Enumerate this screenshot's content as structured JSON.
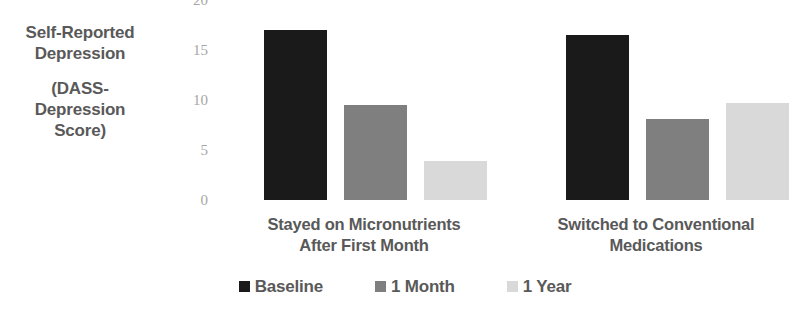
{
  "chart_data": {
    "type": "bar",
    "title": "",
    "subtitle": "",
    "xlabel": "",
    "ylabel": "Self-Reported Depression (DASS-Depression Score)",
    "ylabel_lines": [
      "Self-Reported",
      "Depression",
      "(DASS-",
      "Depression",
      "Score)"
    ],
    "categories": [
      "Stayed on Micronutrients After First Month",
      "Switched to Conventional Medications"
    ],
    "category_lines": [
      [
        "Stayed on Micronutrients",
        "After First Month"
      ],
      [
        "Switched to Conventional",
        "Medications"
      ]
    ],
    "series": [
      {
        "name": "Baseline",
        "color": "#1a1a1a",
        "values": [
          17.0,
          16.5
        ]
      },
      {
        "name": "1 Month",
        "color": "#7f7f7f",
        "values": [
          9.5,
          8.1
        ]
      },
      {
        "name": "1 Year",
        "color": "#d9d9d9",
        "values": [
          3.9,
          9.7
        ]
      }
    ],
    "ylim": [
      0,
      20
    ],
    "yticks": [
      0,
      5,
      10,
      15,
      20
    ],
    "ytick_labels": [
      "0",
      "5",
      "10",
      "15",
      "20"
    ],
    "grid": false,
    "legend_position": "bottom"
  },
  "axis": {
    "tick_color": "#a6a6a6",
    "label_color": "#595959"
  }
}
